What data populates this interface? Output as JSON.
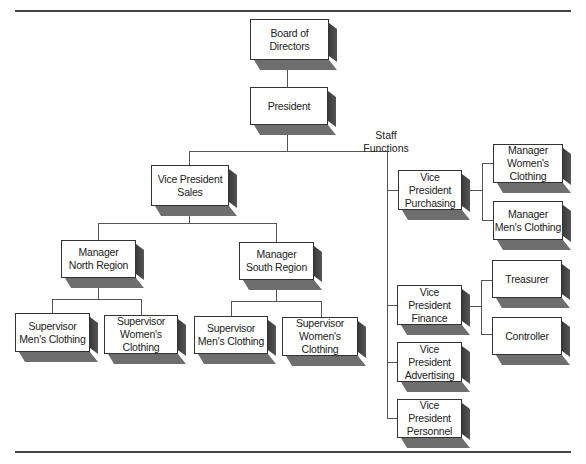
{
  "chart_title": "Organization chart",
  "staff_label": [
    "Staff",
    "Functions"
  ],
  "nodes": {
    "board": [
      "Board of",
      "Directors"
    ],
    "president": [
      "President"
    ],
    "vp_sales": [
      "Vice President",
      "Sales"
    ],
    "mgr_north": [
      "Manager",
      "North Region"
    ],
    "mgr_south": [
      "Manager",
      "South Region"
    ],
    "sup_n_men": [
      "Supervisor",
      "Men's Clothing"
    ],
    "sup_n_women": [
      "Supervisor",
      "Women's Clothing"
    ],
    "sup_s_men": [
      "Supervisor",
      "Men's Clothing"
    ],
    "sup_s_women": [
      "Supervisor",
      "Women's Clothing"
    ],
    "vp_purchasing": [
      "Vice President",
      "Purchasing"
    ],
    "mgr_women": [
      "Manager",
      "Women's",
      "Clothing"
    ],
    "mgr_men": [
      "Manager",
      "Men's Clothing"
    ],
    "vp_finance": [
      "Vice President",
      "Finance"
    ],
    "treasurer": [
      "Treasurer"
    ],
    "controller": [
      "Controller"
    ],
    "vp_advertising": [
      "Vice President",
      "Advertising"
    ],
    "vp_personnel": [
      "Vice President",
      "Personnel"
    ]
  },
  "hierarchy": {
    "Board of Directors": {
      "President": {
        "Vice President Sales": {
          "Manager North Region": [
            "Supervisor Men's Clothing",
            "Supervisor Women's Clothing"
          ],
          "Manager South Region": [
            "Supervisor Men's Clothing",
            "Supervisor Women's Clothing"
          ]
        },
        "Staff Functions": {
          "Vice President Purchasing": [
            "Manager Women's Clothing",
            "Manager Men's Clothing"
          ],
          "Vice President Finance": [
            "Treasurer",
            "Controller"
          ],
          "Vice President Advertising": [],
          "Vice President Personnel": []
        }
      }
    }
  }
}
